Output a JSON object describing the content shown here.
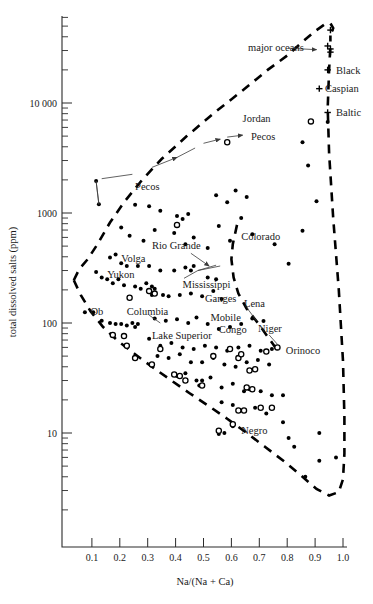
{
  "chart_data": {
    "type": "scatter",
    "title": "",
    "xlabel": "Na/(Na + Ca)",
    "ylabel": "total dissolved salts (ppm)",
    "xlim": [
      0.0,
      1.02
    ],
    "ylim": [
      2.2,
      60000
    ],
    "yscale": "log",
    "grid": false,
    "legend": null,
    "xticks": [
      0.1,
      0.2,
      0.3,
      0.4,
      0.5,
      0.6,
      0.7,
      0.8,
      0.9,
      1.0
    ],
    "xticklabels": [
      "0.1",
      "0.2",
      "0.3",
      "0.4",
      "0.5",
      "0.6",
      "0.7",
      "0.8",
      "0.9",
      "1.0"
    ],
    "yticks": [
      10,
      100,
      1000,
      10000
    ],
    "yticklabels": [
      "10",
      "100",
      "1000",
      "10 000"
    ],
    "series": [
      {
        "name": "rivers and lakes (filled circles)",
        "marker": "filled-circle",
        "points": [
          [
            0.115,
            1950
          ],
          [
            0.125,
            1200
          ],
          [
            0.255,
            1190
          ],
          [
            0.305,
            1150
          ],
          [
            0.345,
            1050
          ],
          [
            0.405,
            940
          ],
          [
            0.425,
            880
          ],
          [
            0.445,
            980
          ],
          [
            0.545,
            1450
          ],
          [
            0.585,
            1250
          ],
          [
            0.615,
            1600
          ],
          [
            0.655,
            1400
          ],
          [
            0.205,
            740
          ],
          [
            0.235,
            620
          ],
          [
            0.285,
            560
          ],
          [
            0.325,
            700
          ],
          [
            0.395,
            660
          ],
          [
            0.435,
            520
          ],
          [
            0.465,
            600
          ],
          [
            0.515,
            480
          ],
          [
            0.555,
            760
          ],
          [
            0.595,
            560
          ],
          [
            0.635,
            900
          ],
          [
            0.675,
            640
          ],
          [
            0.165,
            395
          ],
          [
            0.185,
            420
          ],
          [
            0.205,
            350
          ],
          [
            0.225,
            330
          ],
          [
            0.265,
            330
          ],
          [
            0.305,
            330
          ],
          [
            0.345,
            300
          ],
          [
            0.395,
            300
          ],
          [
            0.435,
            320
          ],
          [
            0.455,
            300
          ],
          [
            0.465,
            330
          ],
          [
            0.515,
            260
          ],
          [
            0.545,
            250
          ],
          [
            0.115,
            290
          ],
          [
            0.135,
            260
          ],
          [
            0.155,
            250
          ],
          [
            0.175,
            230
          ],
          [
            0.195,
            250
          ],
          [
            0.215,
            220
          ],
          [
            0.255,
            215
          ],
          [
            0.275,
            205
          ],
          [
            0.295,
            230
          ],
          [
            0.315,
            215
          ],
          [
            0.305,
            190
          ],
          [
            0.315,
            180
          ],
          [
            0.325,
            205
          ],
          [
            0.355,
            180
          ],
          [
            0.375,
            175
          ],
          [
            0.415,
            180
          ],
          [
            0.455,
            185
          ],
          [
            0.495,
            175
          ],
          [
            0.535,
            195
          ],
          [
            0.565,
            165
          ],
          [
            0.075,
            125
          ],
          [
            0.105,
            125
          ],
          [
            0.135,
            105
          ],
          [
            0.165,
            100
          ],
          [
            0.185,
            98
          ],
          [
            0.205,
            98
          ],
          [
            0.225,
            95
          ],
          [
            0.245,
            100
          ],
          [
            0.255,
            92
          ],
          [
            0.265,
            98
          ],
          [
            0.325,
            110
          ],
          [
            0.365,
            105
          ],
          [
            0.405,
            108
          ],
          [
            0.445,
            100
          ],
          [
            0.475,
            112
          ],
          [
            0.515,
            98
          ],
          [
            0.555,
            88
          ],
          [
            0.595,
            92
          ],
          [
            0.635,
            98
          ],
          [
            0.675,
            110
          ],
          [
            0.715,
            104
          ],
          [
            0.305,
            72
          ],
          [
            0.345,
            62
          ],
          [
            0.385,
            66
          ],
          [
            0.425,
            60
          ],
          [
            0.465,
            58
          ],
          [
            0.505,
            62
          ],
          [
            0.545,
            60
          ],
          [
            0.585,
            56
          ],
          [
            0.625,
            60
          ],
          [
            0.665,
            62
          ],
          [
            0.705,
            56
          ],
          [
            0.745,
            58
          ],
          [
            0.335,
            50
          ],
          [
            0.375,
            48
          ],
          [
            0.415,
            52
          ],
          [
            0.455,
            44
          ],
          [
            0.495,
            44
          ],
          [
            0.535,
            48
          ],
          [
            0.575,
            42
          ],
          [
            0.615,
            40
          ],
          [
            0.655,
            44
          ],
          [
            0.695,
            46
          ],
          [
            0.735,
            42
          ],
          [
            0.395,
            34
          ],
          [
            0.405,
            33
          ],
          [
            0.435,
            35
          ],
          [
            0.475,
            30
          ],
          [
            0.485,
            27
          ],
          [
            0.495,
            30
          ],
          [
            0.525,
            32
          ],
          [
            0.565,
            26
          ],
          [
            0.605,
            28
          ],
          [
            0.645,
            24
          ],
          [
            0.665,
            25
          ],
          [
            0.705,
            24
          ],
          [
            0.745,
            22
          ],
          [
            0.785,
            22
          ],
          [
            0.565,
            19
          ],
          [
            0.605,
            18
          ],
          [
            0.645,
            16
          ],
          [
            0.685,
            17
          ],
          [
            0.725,
            15
          ],
          [
            0.555,
            9.8
          ],
          [
            0.575,
            10.0
          ],
          [
            0.605,
            11.5
          ],
          [
            0.785,
            12.5
          ],
          [
            0.805,
            9.0
          ],
          [
            0.825,
            7.5
          ],
          [
            0.915,
            10.0
          ],
          [
            0.915,
            5.6
          ],
          [
            0.975,
            6.0
          ],
          [
            0.865,
            4.0
          ],
          [
            0.855,
            690
          ],
          [
            0.755,
            520
          ],
          [
            0.805,
            345
          ],
          [
            0.905,
            1280
          ],
          [
            0.875,
            2700
          ],
          [
            0.855,
            4400
          ],
          [
            0.945,
            6700
          ]
        ]
      },
      {
        "name": "rivers and lakes (open circles)",
        "marker": "open-circle",
        "points": [
          [
            0.405,
            780
          ],
          [
            0.885,
            6800
          ],
          [
            0.585,
            4400
          ],
          [
            0.235,
            170
          ],
          [
            0.305,
            195
          ],
          [
            0.325,
            185
          ],
          [
            0.175,
            78
          ],
          [
            0.215,
            76
          ],
          [
            0.225,
            62
          ],
          [
            0.255,
            48
          ],
          [
            0.315,
            42
          ],
          [
            0.395,
            34
          ],
          [
            0.415,
            33
          ],
          [
            0.495,
            27
          ],
          [
            0.535,
            50
          ],
          [
            0.595,
            58
          ],
          [
            0.625,
            48
          ],
          [
            0.635,
            52
          ],
          [
            0.665,
            37
          ],
          [
            0.685,
            38
          ],
          [
            0.655,
            26
          ],
          [
            0.675,
            25
          ],
          [
            0.705,
            17
          ],
          [
            0.745,
            17
          ],
          [
            0.625,
            16
          ],
          [
            0.645,
            16
          ],
          [
            0.605,
            12
          ],
          [
            0.555,
            10.5
          ],
          [
            0.765,
            60
          ],
          [
            0.725,
            55
          ],
          [
            0.435,
            30
          ],
          [
            0.345,
            58
          ]
        ]
      },
      {
        "name": "seas (plus markers)",
        "marker": "plus",
        "points": [
          [
            0.955,
            46000
          ],
          [
            0.945,
            33000
          ],
          [
            0.955,
            31000
          ],
          [
            0.955,
            29000
          ],
          [
            0.945,
            20000
          ],
          [
            0.915,
            13500
          ],
          [
            0.945,
            8200
          ]
        ]
      }
    ],
    "annotations": [
      {
        "text": "major oceans",
        "x": 0.66,
        "y": 32000,
        "leader_to": [
          0.93,
          30000
        ]
      },
      {
        "text": "Black",
        "x": 0.975,
        "y": 20000
      },
      {
        "text": "Caspian",
        "x": 0.935,
        "y": 13500
      },
      {
        "text": "Baltic",
        "x": 0.975,
        "y": 8200
      },
      {
        "text": "Jordan",
        "x": 0.64,
        "y": 7200
      },
      {
        "text": "Pecos",
        "x": 0.67,
        "y": 5000
      },
      {
        "text": "Pecos",
        "x": 0.255,
        "y": 1750
      },
      {
        "text": "Rio Grande",
        "x": 0.315,
        "y": 505
      },
      {
        "text": "Colorado",
        "x": 0.635,
        "y": 610
      },
      {
        "text": "Volga",
        "x": 0.205,
        "y": 390
      },
      {
        "text": "Yukon",
        "x": 0.155,
        "y": 275
      },
      {
        "text": "Mississippi",
        "x": 0.425,
        "y": 225
      },
      {
        "text": "Ganges",
        "x": 0.505,
        "y": 168
      },
      {
        "text": "Lena",
        "x": 0.645,
        "y": 152
      },
      {
        "text": "Ob",
        "x": 0.095,
        "y": 128
      },
      {
        "text": "Columbia",
        "x": 0.225,
        "y": 127
      },
      {
        "text": "Mobile",
        "x": 0.525,
        "y": 112
      },
      {
        "text": "Congo",
        "x": 0.555,
        "y": 88
      },
      {
        "text": "Niger",
        "x": 0.695,
        "y": 90
      },
      {
        "text": "Lake Superior",
        "x": 0.315,
        "y": 78
      },
      {
        "text": "Orinoco",
        "x": 0.795,
        "y": 57
      },
      {
        "text": "Negro",
        "x": 0.635,
        "y": 10.5
      }
    ],
    "envelope_note": "Dashed boomerang-shaped envelope enclosing the world river/lake data field (Gibbs diagram)",
    "trajectory_note": "Pecos River evaporation trajectory shown as arrowed line from low to high salinity"
  },
  "figure": {
    "y_axis_title": "total dissolved salts (ppm)",
    "x_axis_title": "Na/(Na + Ca)"
  }
}
